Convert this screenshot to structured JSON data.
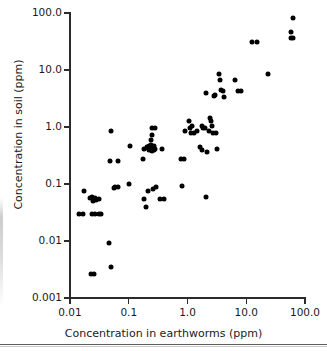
{
  "chart_data": {
    "type": "scatter",
    "title": "",
    "xlabel": "Concentration in earthworms (ppm)",
    "ylabel": "Concentration in soil (ppm)",
    "xscale": "log",
    "yscale": "log",
    "xlim": [
      0.01,
      100.0
    ],
    "ylim": [
      0.001,
      100.0
    ],
    "grid": false,
    "legend": null,
    "xticklabels": [
      "0.01",
      "0.1",
      "1.0",
      "10.0",
      "100.0"
    ],
    "xtickvalues": [
      0.01,
      0.1,
      1.0,
      10.0,
      100.0
    ],
    "yticklabels": [
      "0.001",
      "0.01",
      "0.1",
      "1.0",
      "10.0",
      "100.0"
    ],
    "ytickvalues": [
      0.001,
      0.01,
      0.1,
      1.0,
      10.0,
      100.0
    ],
    "marker": "filled-circle",
    "marker_color": "#000000",
    "n_points": 92,
    "points": [
      [
        0.0145,
        0.03
      ],
      [
        0.0165,
        0.03
      ],
      [
        0.0175,
        0.075
      ],
      [
        0.0225,
        0.0026
      ],
      [
        0.0255,
        0.0026
      ],
      [
        0.0235,
        0.03
      ],
      [
        0.0265,
        0.03
      ],
      [
        0.0235,
        0.058
      ],
      [
        0.0245,
        0.051
      ],
      [
        0.0265,
        0.056
      ],
      [
        0.0315,
        0.03
      ],
      [
        0.0335,
        0.03
      ],
      [
        0.0315,
        0.055
      ],
      [
        0.0465,
        0.0091
      ],
      [
        0.0495,
        0.0035
      ],
      [
        0.0475,
        0.25
      ],
      [
        0.0505,
        0.85
      ],
      [
        0.0585,
        0.088
      ],
      [
        0.0655,
        0.09
      ],
      [
        0.0665,
        0.25
      ],
      [
        0.0995,
        0.102
      ],
      [
        0.105,
        0.46
      ],
      [
        0.175,
        0.27
      ],
      [
        0.185,
        0.055
      ],
      [
        0.195,
        0.04
      ],
      [
        0.205,
        0.44
      ],
      [
        0.215,
        0.42
      ],
      [
        0.225,
        0.4
      ],
      [
        0.225,
        0.46
      ],
      [
        0.235,
        0.4
      ],
      [
        0.245,
        0.43
      ],
      [
        0.255,
        0.44
      ],
      [
        0.245,
        0.38
      ],
      [
        0.235,
        0.6
      ],
      [
        0.245,
        0.72
      ],
      [
        0.245,
        0.95
      ],
      [
        0.275,
        0.97
      ],
      [
        0.255,
        0.41
      ],
      [
        0.265,
        0.4
      ],
      [
        0.285,
        0.41
      ],
      [
        0.215,
        0.075
      ],
      [
        0.255,
        0.083
      ],
      [
        0.295,
        0.09
      ],
      [
        0.345,
        0.055
      ],
      [
        0.375,
        0.41
      ],
      [
        0.395,
        0.055
      ],
      [
        0.78,
        0.27
      ],
      [
        0.88,
        0.27
      ],
      [
        0.8,
        0.092
      ],
      [
        0.92,
        0.85
      ],
      [
        1.05,
        1.3
      ],
      [
        1.1,
        0.97
      ],
      [
        1.2,
        1.05
      ],
      [
        1.15,
        0.8
      ],
      [
        1.45,
        0.85
      ],
      [
        1.75,
        1.05
      ],
      [
        1.85,
        0.95
      ],
      [
        1.95,
        0.97
      ],
      [
        1.65,
        0.44
      ],
      [
        1.75,
        0.4
      ],
      [
        2.05,
        0.058
      ],
      [
        2.15,
        0.37
      ],
      [
        2.45,
        1.45
      ],
      [
        2.55,
        1.25
      ],
      [
        2.6,
        1.05
      ],
      [
        2.7,
        0.8
      ],
      [
        2.8,
        3.5
      ],
      [
        2.95,
        3.6
      ],
      [
        2.1,
        3.9
      ],
      [
        3.2,
        0.41
      ],
      [
        3.4,
        8.5
      ],
      [
        3.55,
        6.6
      ],
      [
        3.7,
        4.4
      ],
      [
        3.95,
        4.3
      ],
      [
        4.1,
        3.3
      ],
      [
        6.5,
        6.6
      ],
      [
        7.2,
        4.3
      ],
      [
        8.2,
        4.3
      ],
      [
        12.5,
        31.0
      ],
      [
        15.0,
        31.0
      ],
      [
        23.0,
        8.5
      ],
      [
        57.0,
        36.0
      ],
      [
        63.0,
        36.0
      ],
      [
        58.0,
        46.0
      ],
      [
        62.0,
        82.0
      ],
      [
        0.0215,
        0.056
      ],
      [
        0.0275,
        0.052
      ],
      [
        1.3,
        0.78
      ],
      [
        2.3,
        0.85
      ],
      [
        0.185,
        0.41
      ],
      [
        0.265,
        0.46
      ],
      [
        0.235,
        0.48
      ],
      [
        3.05,
        0.78
      ],
      [
        0.0555,
        0.085
      ]
    ]
  }
}
